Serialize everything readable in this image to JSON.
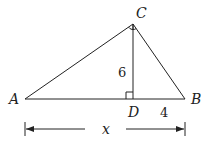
{
  "figure": {
    "type": "right-triangle-with-altitude",
    "points": {
      "A": {
        "label": "A"
      },
      "B": {
        "label": "B"
      },
      "C": {
        "label": "C"
      },
      "D": {
        "label": "D"
      }
    },
    "segment_labels": {
      "CD": "6",
      "DB": "4",
      "AB": "x"
    },
    "right_angles": [
      "ACB",
      "CDA"
    ],
    "stroke_color": "#222222"
  }
}
